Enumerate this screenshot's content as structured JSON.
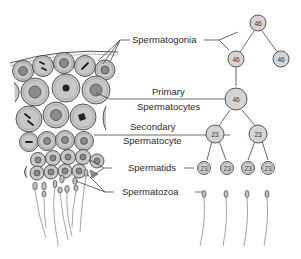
{
  "diagram": {
    "stages": [
      {
        "id": "spermatogonia",
        "label_lines": [
          "Spermatogonia"
        ],
        "chromosome_count": 46
      },
      {
        "id": "primary-spermatocytes",
        "label_lines": [
          "Primary",
          "Spermatocytes"
        ],
        "chromosome_count": 46
      },
      {
        "id": "secondary-spermatocyte",
        "label_lines": [
          "Secondary",
          "Spermatocyte"
        ],
        "chromosome_count": 23
      },
      {
        "id": "spermatids",
        "label_lines": [
          "Spermatids"
        ],
        "chromosome_count": 23
      },
      {
        "id": "spermatozoa",
        "label_lines": [
          "Spermatozoa"
        ],
        "chromosome_count": null
      }
    ],
    "tree_nodes": {
      "top_spermatogonium": "46",
      "spermatogonium_left": "46",
      "spermatogonium_right": "46",
      "primary_spermatocyte": "46",
      "secondary_left": "23",
      "secondary_right": "23",
      "spermatid_1": "23",
      "spermatid_2": "23",
      "spermatid_3": "23",
      "spermatid_4": "23"
    },
    "colors": {
      "cell_fill": "#c8c8c8",
      "node_fill": "#d4d4d4",
      "line": "#444444",
      "text": "#2a2a2a"
    }
  }
}
